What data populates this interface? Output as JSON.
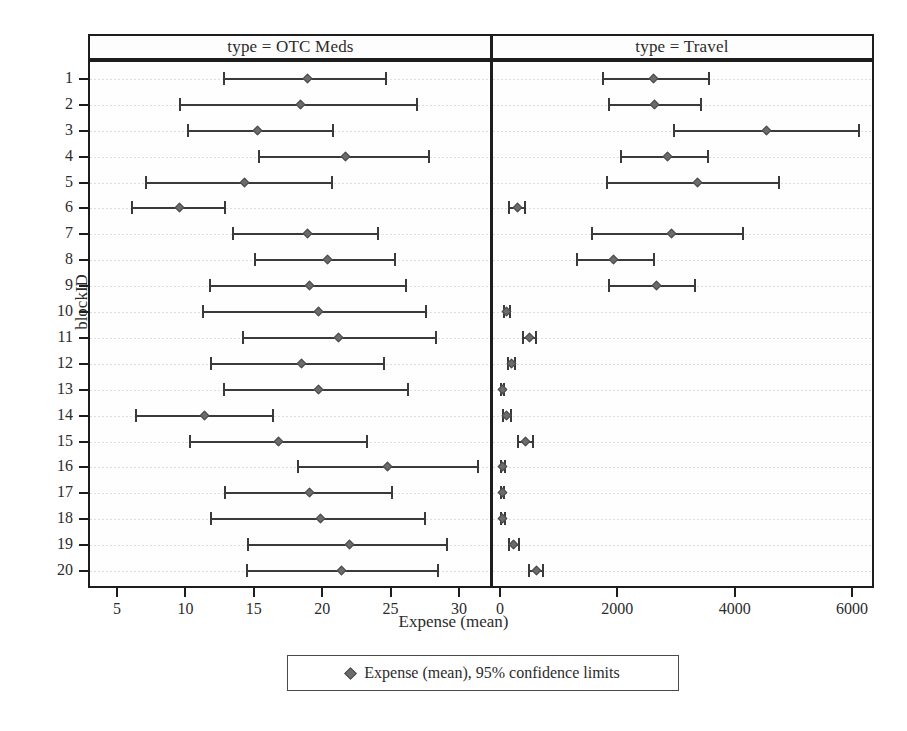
{
  "axes": {
    "ylabel": "blockID",
    "xlabel": "Expense (mean)",
    "y_categories": [
      "1",
      "2",
      "3",
      "4",
      "5",
      "6",
      "7",
      "8",
      "9",
      "10",
      "11",
      "12",
      "13",
      "14",
      "15",
      "16",
      "17",
      "18",
      "19",
      "20"
    ]
  },
  "panels": [
    {
      "header": "type = OTC Meds",
      "xticks": [
        "5",
        "10",
        "15",
        "20",
        "25",
        "30"
      ]
    },
    {
      "header": "type = Travel",
      "xticks": [
        "0",
        "2000",
        "4000",
        "6000"
      ]
    }
  ],
  "legend": {
    "marker": "diamond-marker",
    "label": "Expense (mean), 95% confidence limits"
  },
  "colors": {
    "frame": "#1d1d1d",
    "interval": "#3a3a3a",
    "mean_marker": "#6b6b6b",
    "gridline": "#d8d8d8",
    "background": "#ffffff"
  },
  "chart_data": {
    "type": "scatter",
    "title": "",
    "subtitle": "",
    "xlabel": "Expense (mean)",
    "ylabel": "blockID",
    "grid": true,
    "legend_position": "bottom",
    "panel_variable": "type",
    "categories": [
      "1",
      "2",
      "3",
      "4",
      "5",
      "6",
      "7",
      "8",
      "9",
      "10",
      "11",
      "12",
      "13",
      "14",
      "15",
      "16",
      "17",
      "18",
      "19",
      "20"
    ],
    "series": [
      {
        "name": "type = OTC Meds",
        "xlim": [
          4.0,
          32.0
        ],
        "xticks": [
          5,
          10,
          15,
          20,
          25,
          30
        ],
        "error_kind": "95% confidence limits",
        "points": [
          {
            "blockID": "1",
            "mean": 18.9,
            "lower": 12.8,
            "upper": 24.7
          },
          {
            "blockID": "2",
            "mean": 18.4,
            "lower": 9.6,
            "upper": 26.9
          },
          {
            "blockID": "3",
            "mean": 15.3,
            "lower": 10.2,
            "upper": 20.8
          },
          {
            "blockID": "4",
            "mean": 21.7,
            "lower": 15.4,
            "upper": 27.8
          },
          {
            "blockID": "5",
            "mean": 14.3,
            "lower": 7.1,
            "upper": 20.7
          },
          {
            "blockID": "6",
            "mean": 9.6,
            "lower": 6.1,
            "upper": 12.9
          },
          {
            "blockID": "7",
            "mean": 18.9,
            "lower": 13.5,
            "upper": 24.1
          },
          {
            "blockID": "8",
            "mean": 20.4,
            "lower": 15.1,
            "upper": 25.3
          },
          {
            "blockID": "9",
            "mean": 19.1,
            "lower": 11.8,
            "upper": 26.1
          },
          {
            "blockID": "10",
            "mean": 19.7,
            "lower": 11.3,
            "upper": 27.6
          },
          {
            "blockID": "11",
            "mean": 21.2,
            "lower": 14.2,
            "upper": 28.3
          },
          {
            "blockID": "12",
            "mean": 18.5,
            "lower": 11.9,
            "upper": 24.5
          },
          {
            "blockID": "13",
            "mean": 19.7,
            "lower": 12.8,
            "upper": 26.3
          },
          {
            "blockID": "14",
            "mean": 11.4,
            "lower": 6.4,
            "upper": 16.4
          },
          {
            "blockID": "15",
            "mean": 16.8,
            "lower": 10.3,
            "upper": 23.3
          },
          {
            "blockID": "16",
            "mean": 24.8,
            "lower": 18.2,
            "upper": 31.4
          },
          {
            "blockID": "17",
            "mean": 19.1,
            "lower": 12.9,
            "upper": 25.1
          },
          {
            "blockID": "18",
            "mean": 19.9,
            "lower": 11.9,
            "upper": 27.5
          },
          {
            "blockID": "19",
            "mean": 22.0,
            "lower": 14.6,
            "upper": 29.1
          },
          {
            "blockID": "20",
            "mean": 21.4,
            "lower": 14.5,
            "upper": 28.5
          }
        ]
      },
      {
        "name": "type = Travel",
        "xlim": [
          -200,
          6400
        ],
        "xticks": [
          0,
          2000,
          4000,
          6000
        ],
        "error_kind": "95% confidence limits",
        "points": [
          {
            "blockID": "1",
            "mean": 2620,
            "lower": 1750,
            "upper": 3560
          },
          {
            "blockID": "2",
            "mean": 2640,
            "lower": 1860,
            "upper": 3420
          },
          {
            "blockID": "3",
            "mean": 4540,
            "lower": 2970,
            "upper": 6120
          },
          {
            "blockID": "4",
            "mean": 2860,
            "lower": 2070,
            "upper": 3550
          },
          {
            "blockID": "5",
            "mean": 3360,
            "lower": 1830,
            "upper": 4760
          },
          {
            "blockID": "6",
            "mean": 290,
            "lower": 160,
            "upper": 430
          },
          {
            "blockID": "7",
            "mean": 2930,
            "lower": 1560,
            "upper": 4140
          },
          {
            "blockID": "8",
            "mean": 1940,
            "lower": 1310,
            "upper": 2630
          },
          {
            "blockID": "9",
            "mean": 2660,
            "lower": 1860,
            "upper": 3330
          },
          {
            "blockID": "10",
            "mean": 110,
            "lower": 60,
            "upper": 170
          },
          {
            "blockID": "11",
            "mean": 500,
            "lower": 400,
            "upper": 610
          },
          {
            "blockID": "12",
            "mean": 190,
            "lower": 130,
            "upper": 260
          },
          {
            "blockID": "13",
            "mean": 40,
            "lower": 10,
            "upper": 70
          },
          {
            "blockID": "14",
            "mean": 110,
            "lower": 50,
            "upper": 180
          },
          {
            "blockID": "15",
            "mean": 430,
            "lower": 300,
            "upper": 560
          },
          {
            "blockID": "16",
            "mean": 50,
            "lower": 20,
            "upper": 90
          },
          {
            "blockID": "17",
            "mean": 40,
            "lower": 10,
            "upper": 70
          },
          {
            "blockID": "18",
            "mean": 50,
            "lower": 10,
            "upper": 90
          },
          {
            "blockID": "19",
            "mean": 230,
            "lower": 150,
            "upper": 320
          },
          {
            "blockID": "20",
            "mean": 620,
            "lower": 500,
            "upper": 740
          }
        ]
      }
    ]
  }
}
